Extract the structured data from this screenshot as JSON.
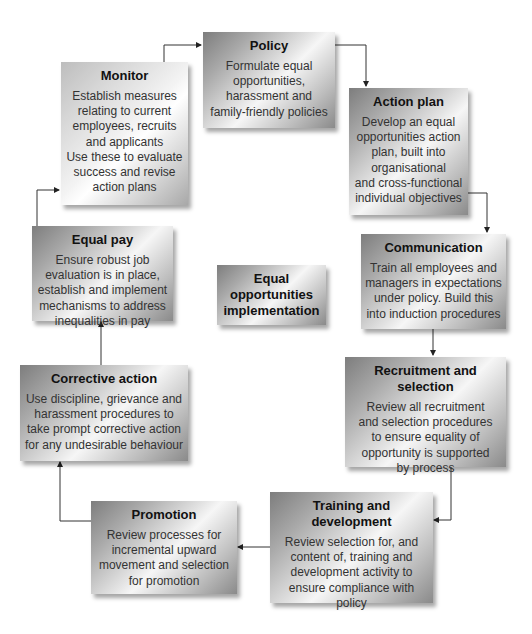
{
  "diagram": {
    "title": "Equal opportunities implementation",
    "center": {
      "label": "Equal opportunities implementation",
      "lines": [
        "Equal",
        "opportunities",
        "implementation"
      ]
    },
    "cycle_order": [
      "policy",
      "action_plan",
      "communication",
      "recruitment",
      "training",
      "promotion",
      "corrective",
      "equal_pay",
      "monitor"
    ],
    "boxes": {
      "policy": {
        "title": "Policy",
        "lines": [
          "Formulate equal",
          "opportunities,",
          "harassment and",
          "family-friendly policies"
        ]
      },
      "action_plan": {
        "title": "Action plan",
        "lines": [
          "Develop an equal",
          "opportunities action",
          "plan, built into",
          "organisational",
          "and cross-functional",
          "individual objectives"
        ]
      },
      "communication": {
        "title": "Communication",
        "lines": [
          "Train all employees and",
          "managers in expectations",
          "under policy. Build this",
          "into induction procedures"
        ]
      },
      "recruitment": {
        "title": "Recruitment and selection",
        "lines": [
          "Review all recruitment",
          "and selection procedures",
          "to ensure equality of",
          "opportunity is supported",
          "by process"
        ]
      },
      "training": {
        "title": "Training and development",
        "lines": [
          "Review selection for, and",
          "content of, training and",
          "development activity to",
          "ensure compliance with",
          "policy"
        ]
      },
      "promotion": {
        "title": "Promotion",
        "lines": [
          "Review processes for",
          "incremental upward",
          "movement and selection",
          "for promotion"
        ]
      },
      "corrective": {
        "title": "Corrective action",
        "lines": [
          "Use discipline, grievance and",
          "harassment procedures to",
          "take prompt corrective action",
          "for any undesirable behaviour"
        ]
      },
      "equal_pay": {
        "title": "Equal pay",
        "lines": [
          "Ensure robust job",
          "evaluation is in place,",
          "establish and implement",
          "mechanisms to address",
          "inequalities in pay"
        ]
      },
      "monitor": {
        "title": "Monitor",
        "lines": [
          "Establish measures",
          "relating to current",
          "employees, recruits",
          "and applicants",
          "Use these to evaluate",
          "success and revise",
          "action plans"
        ]
      }
    },
    "colors": {
      "connector": "#333333",
      "title_text": "#111111",
      "body_text": "#333333",
      "background": "#ffffff"
    }
  }
}
